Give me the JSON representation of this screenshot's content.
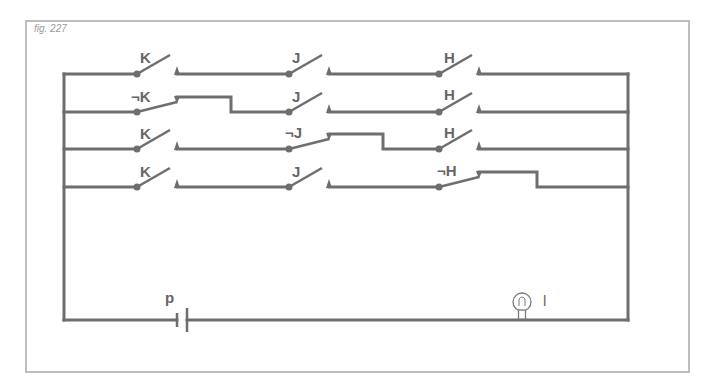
{
  "figure": {
    "caption": "fig. 227",
    "colors": {
      "wire": "#6e6e6e",
      "frame": "#bdbdbd",
      "label": "#666666"
    },
    "rows": [
      {
        "switches": [
          {
            "label": "K",
            "state": "open"
          },
          {
            "label": "J",
            "state": "open"
          },
          {
            "label": "H",
            "state": "open"
          }
        ]
      },
      {
        "switches": [
          {
            "label": "¬K",
            "state": "closed"
          },
          {
            "label": "J",
            "state": "open"
          },
          {
            "label": "H",
            "state": "open"
          }
        ]
      },
      {
        "switches": [
          {
            "label": "K",
            "state": "open"
          },
          {
            "label": "¬J",
            "state": "closed"
          },
          {
            "label": "H",
            "state": "open"
          }
        ]
      },
      {
        "switches": [
          {
            "label": "K",
            "state": "open"
          },
          {
            "label": "J",
            "state": "open"
          },
          {
            "label": "¬H",
            "state": "closed"
          }
        ]
      }
    ],
    "battery": {
      "label": "p"
    },
    "lamp": {
      "label": "l"
    }
  }
}
